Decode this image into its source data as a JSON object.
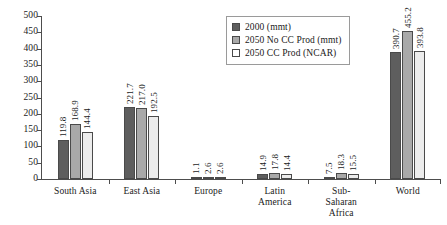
{
  "chart_data": {
    "type": "bar",
    "title": "",
    "xlabel": "",
    "ylabel": "",
    "ylim": [
      0,
      500
    ],
    "yticks": [
      0,
      50,
      100,
      150,
      200,
      250,
      300,
      350,
      400,
      450,
      500
    ],
    "ytick_labels": [
      "0",
      "50",
      "100",
      "150",
      "200",
      "250",
      "300",
      "350",
      "400",
      "450",
      "500"
    ],
    "grid": false,
    "legend_position": "top-center-right",
    "categories": [
      "South Asia",
      "East Asia",
      "Europe",
      "Latin\nAmerica",
      "Sub-\nSaharan\nAfrica",
      "World"
    ],
    "series": [
      {
        "name": "2000 (mmt)",
        "color": "#5e5e5e",
        "values": [
          119.8,
          221.7,
          1.1,
          14.9,
          7.5,
          390.7
        ],
        "labels": [
          "119.8",
          "221.7",
          "1.1",
          "14.9",
          "7.5",
          "390.7"
        ]
      },
      {
        "name": "2050 No CC Prod (mmt)",
        "color": "#a9a9a9",
        "values": [
          168.9,
          217.0,
          2.6,
          17.8,
          18.3,
          455.2
        ],
        "labels": [
          "168.9",
          "217.0",
          "2.6",
          "17.8",
          "18.3",
          "455.2"
        ]
      },
      {
        "name": "2050 CC Prod (NCAR)",
        "color": "#ececec",
        "values": [
          144.4,
          192.5,
          2.6,
          14.4,
          15.5,
          393.8
        ],
        "labels": [
          "144.4",
          "192.5",
          "2.6",
          "14.4",
          "15.5",
          "393.8"
        ]
      }
    ]
  },
  "legend": {
    "items": [
      {
        "label": "2000 (mmt)"
      },
      {
        "label": "2050 No CC Prod (mmt)"
      },
      {
        "label": "2050 CC Prod (NCAR)"
      }
    ]
  }
}
